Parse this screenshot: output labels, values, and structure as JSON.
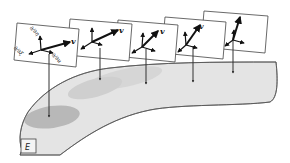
{
  "diagram": {
    "manifold_label": "E",
    "vector_label": "v",
    "basis_labels": [
      "∂/∂η",
      "∂/∂ξ",
      "∂/∂u"
    ],
    "plane_count": 5,
    "colors": {
      "surface_fill": "#e4e4e4",
      "surface_stroke": "#555555",
      "shade_mid": "#cfcfcf",
      "shade_dark": "#b5b5b5",
      "plane_fill": "#ffffff",
      "ink": "#111111"
    }
  }
}
